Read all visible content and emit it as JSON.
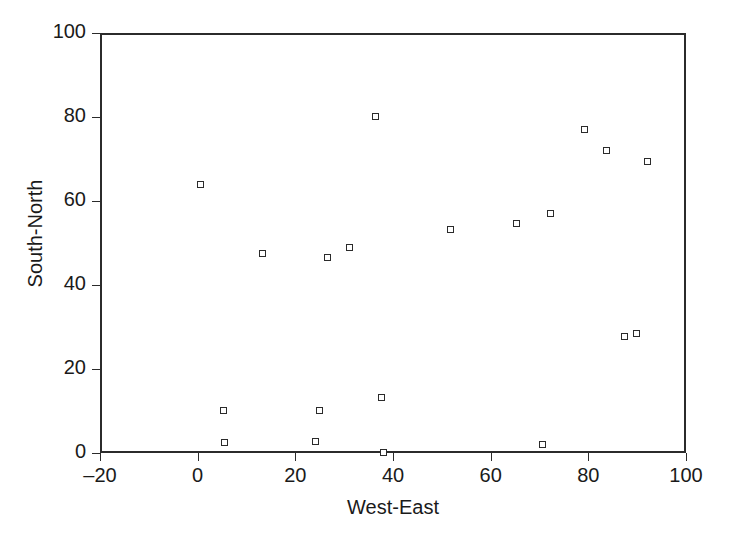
{
  "chart_data": {
    "type": "scatter",
    "title": "",
    "xlabel": "West-East",
    "ylabel": "South-North",
    "xlim": [
      -20,
      100
    ],
    "ylim": [
      0,
      100
    ],
    "xticks": [
      -20,
      0,
      20,
      40,
      60,
      80,
      100
    ],
    "yticks": [
      0,
      20,
      40,
      60,
      80,
      100
    ],
    "xtick_labels": [
      "–20",
      "0",
      "20",
      "40",
      "60",
      "80",
      "100"
    ],
    "ytick_labels": [
      "0",
      "20",
      "40",
      "60",
      "80",
      "100"
    ],
    "grid": false,
    "legend": null,
    "marker": "open-square",
    "marker_color": "#2b2b2b",
    "series": [
      {
        "name": "sample-locations",
        "points": [
          {
            "x": 0.2,
            "y": 64.3
          },
          {
            "x": 4.9,
            "y": 10.7
          },
          {
            "x": 5.1,
            "y": 3.0
          },
          {
            "x": 12.9,
            "y": 47.9
          },
          {
            "x": 23.7,
            "y": 3.3
          },
          {
            "x": 24.5,
            "y": 10.7
          },
          {
            "x": 26.1,
            "y": 47.1
          },
          {
            "x": 30.6,
            "y": 49.3
          },
          {
            "x": 36.1,
            "y": 80.5
          },
          {
            "x": 37.3,
            "y": 13.6
          },
          {
            "x": 37.6,
            "y": 0.5
          },
          {
            "x": 51.4,
            "y": 53.8
          },
          {
            "x": 64.9,
            "y": 55.2
          },
          {
            "x": 70.2,
            "y": 2.6
          },
          {
            "x": 71.8,
            "y": 57.4
          },
          {
            "x": 78.8,
            "y": 77.6
          },
          {
            "x": 83.3,
            "y": 72.4
          },
          {
            "x": 86.9,
            "y": 28.2
          },
          {
            "x": 89.4,
            "y": 28.9
          },
          {
            "x": 91.8,
            "y": 69.8
          }
        ]
      }
    ]
  }
}
